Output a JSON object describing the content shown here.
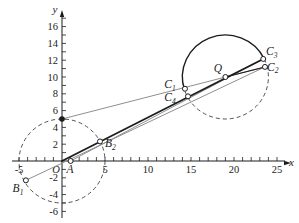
{
  "figure": {
    "colors": {
      "ink": "#1c1c1c",
      "gray": "#8f8f8f",
      "dash": "#3d3d3d",
      "bg": "#ffffff"
    },
    "transform": {
      "origin_px": [
        62,
        161
      ],
      "px_per_unit_x": 8.6,
      "px_per_unit_y": 8.4
    },
    "axes": {
      "x_label": "x",
      "y_label": "y",
      "origin_label": "O",
      "x_span_px": [
        12,
        285
      ],
      "y_span_px": [
        218,
        16
      ],
      "x_minor_range": [
        -5,
        25
      ],
      "y_minor_range": [
        -6,
        17
      ],
      "x_tick_labels": [
        {
          "v": -5,
          "t": "-5"
        },
        {
          "v": 5,
          "t": "5"
        },
        {
          "v": 10,
          "t": "10"
        },
        {
          "v": 15,
          "t": "15"
        },
        {
          "v": 20,
          "t": "20"
        },
        {
          "v": 25,
          "t": "25"
        }
      ],
      "y_tick_labels": [
        {
          "v": 16,
          "t": "16"
        },
        {
          "v": 14,
          "t": "14"
        },
        {
          "v": 12,
          "t": "12"
        },
        {
          "v": 10,
          "t": "10"
        },
        {
          "v": 8,
          "t": "8"
        },
        {
          "v": 6,
          "t": "6"
        },
        {
          "v": 4,
          "t": "4"
        },
        {
          "v": 2,
          "t": "2"
        },
        {
          "v": -2,
          "t": "-2"
        },
        {
          "v": -4,
          "t": "-4"
        },
        {
          "v": -6,
          "t": "-6"
        }
      ]
    },
    "circles": [
      {
        "name": "circle-O-dashed",
        "cx": 0,
        "cy": 0,
        "r": 5,
        "segments": [
          {
            "full": true,
            "dashed": true
          }
        ]
      },
      {
        "name": "circle-Q",
        "cx": 19,
        "cy": 10,
        "r": 5,
        "segments": [
          {
            "from_deg": 198.8,
            "to_deg": 25.5,
            "dashed": false,
            "large": 0,
            "sweep": 1
          },
          {
            "from_deg": 25.5,
            "to_deg": 198.8,
            "dashed": true,
            "large": 1,
            "sweep": 1
          }
        ]
      }
    ],
    "lines": [
      {
        "name": "line-B1-C2",
        "from": [
          -4.2,
          -2.3
        ],
        "to": [
          23.6,
          11.2
        ],
        "color": "gray",
        "w": 1
      },
      {
        "name": "line-A-C3",
        "from": [
          1,
          0
        ],
        "to": [
          23.4,
          12.15
        ],
        "color": "gray",
        "w": 1
      },
      {
        "name": "line-P-C2",
        "from": [
          0,
          5
        ],
        "to": [
          23.6,
          11.2
        ],
        "color": "gray",
        "w": 1
      },
      {
        "name": "line-O-C3",
        "from": [
          0,
          0
        ],
        "to": [
          23.4,
          12.15
        ],
        "color": "ink",
        "w": 1.8
      },
      {
        "name": "line-Q-C2",
        "from": [
          19,
          10
        ],
        "to": [
          23.6,
          11.2
        ],
        "color": "ink",
        "w": 1.1
      }
    ],
    "points": [
      {
        "name": "A",
        "label": "A",
        "sub": "",
        "x": 1,
        "y": 0,
        "style": "open",
        "lx": 70,
        "ly": 172.5,
        "anchor": "middle"
      },
      {
        "name": "B1",
        "label": "B",
        "sub": "1",
        "x": -4.2,
        "y": -2.3,
        "style": "open",
        "lx": 18,
        "ly": 192,
        "anchor": "middle"
      },
      {
        "name": "B2",
        "label": "B",
        "sub": "2",
        "x": 4.42,
        "y": 2.33,
        "style": "open",
        "lx": 105,
        "ly": 147,
        "anchor": "start"
      },
      {
        "name": "P",
        "label": "",
        "sub": "",
        "x": 0,
        "y": 5,
        "style": "filled",
        "lx": 0,
        "ly": 0,
        "anchor": "middle"
      },
      {
        "name": "Q",
        "label": "Q",
        "sub": "",
        "x": 19,
        "y": 10,
        "style": "open",
        "lx": 218,
        "ly": 72,
        "anchor": "middle"
      },
      {
        "name": "C1",
        "label": "C",
        "sub": "1",
        "x": 14.3,
        "y": 8.6,
        "style": "open",
        "lx": 170,
        "ly": 88,
        "anchor": "middle"
      },
      {
        "name": "C4",
        "label": "C",
        "sub": "4",
        "x": 14.65,
        "y": 7.7,
        "style": "open",
        "lx": 170,
        "ly": 101,
        "anchor": "middle"
      },
      {
        "name": "C3",
        "label": "C",
        "sub": "3",
        "x": 23.4,
        "y": 12.15,
        "style": "open",
        "lx": 266,
        "ly": 55,
        "anchor": "start"
      },
      {
        "name": "C2",
        "label": "C",
        "sub": "2",
        "x": 23.6,
        "y": 11.2,
        "style": "open",
        "lx": 267,
        "ly": 70.5,
        "anchor": "start"
      }
    ]
  }
}
